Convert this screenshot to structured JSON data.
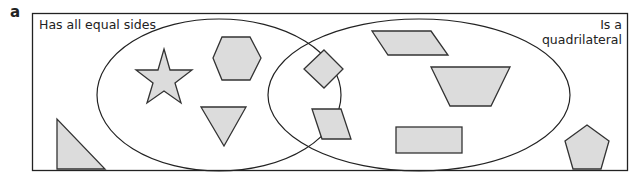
{
  "part_label": "a",
  "diagram": {
    "type": "venn",
    "sets": [
      {
        "name": "Has all equal sides",
        "position": "left"
      },
      {
        "name": "Is a quadrilateral",
        "position": "right",
        "lines": [
          "Is a",
          "quadrilateral"
        ]
      }
    ],
    "regions": {
      "left_only": [
        "star",
        "regular hexagon",
        "equilateral triangle"
      ],
      "intersection": [
        "square (rotated)",
        "rhombus"
      ],
      "right_only": [
        "parallelogram",
        "trapezium",
        "rectangle"
      ],
      "outside": [
        "right-angled triangle",
        "regular pentagon"
      ]
    },
    "colors": {
      "shape_fill": "#dcdcdc",
      "stroke": "#222222"
    }
  }
}
